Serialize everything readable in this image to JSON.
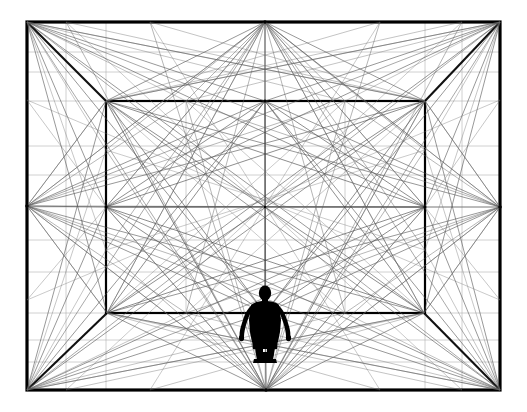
{
  "artwork": {
    "title": "One-Point Perspective Room with Human Figure",
    "type": "line-drawing",
    "medium": "black ink on white",
    "canvas": {
      "width": 527,
      "height": 412
    },
    "background_color": "#ffffff",
    "line_color_heavy": "#000000",
    "line_color_light": "#555555",
    "line_color_faint": "#8a8a8a",
    "figure_color": "#000000"
  },
  "geometry": {
    "outer_rect": {
      "left": 27,
      "top": 22,
      "right": 500,
      "bottom": 390
    },
    "inner_rect": {
      "left": 106,
      "top": 101,
      "right": 425,
      "bottom": 313
    },
    "outer_nodes": {
      "tl": [
        27,
        22
      ],
      "tm": [
        265,
        22
      ],
      "tr": [
        500,
        22
      ],
      "rm": [
        500,
        207
      ],
      "br": [
        500,
        390
      ],
      "bm": [
        266,
        390
      ],
      "bl": [
        27,
        390
      ],
      "lm": [
        27,
        206
      ]
    },
    "inner_nodes": {
      "tl": [
        106,
        101
      ],
      "tm": [
        265,
        101
      ],
      "tr": [
        425,
        101
      ],
      "rm": [
        425,
        207
      ],
      "br": [
        424,
        313
      ],
      "bm": [
        265,
        313
      ],
      "bl": [
        107,
        313
      ],
      "lm": [
        106,
        207
      ]
    },
    "center": [
      265,
      207
    ],
    "outer_stroke_width": 3,
    "inner_stroke_width": 2,
    "web_stroke_width": 0.6
  },
  "figure": {
    "name": "human-silhouette",
    "anchor_x": 265,
    "feet_y": 362,
    "head_y": 288,
    "height_px": 74,
    "pose": "standing, arms slightly away from body, facing viewer"
  },
  "labels": {
    "alt_text": "Black and white one-point perspective drawing of a rectangular room interior with a dense web of straight construction lines radiating between corner and midpoint nodes of the outer frame and the inner back wall, with a small black human silhouette standing at the bottom center."
  }
}
